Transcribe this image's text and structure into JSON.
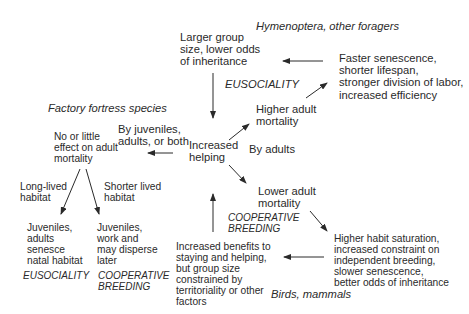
{
  "diagram": {
    "nodes": {
      "hymenoptera_label": "Hymenoptera, other foragers",
      "larger_group": "Larger group\nsize, lower odds\nof inheritance",
      "eusociality_top": "EUSOCIALITY",
      "faster_senescence": "Faster senescence,\nshorter lifespan,\nstronger division of labor,\nincreased efficiency",
      "higher_adult_mortality": "Higher adult\nmortality",
      "by_adults": "By adults",
      "factory_fortress_label": "Factory fortress species",
      "by_juveniles": "By juveniles,\nadults, or both",
      "increased_helping": "Increased\nhelping",
      "no_little_effect": "No or little\neffect on adult\nmortality",
      "long_lived_habitat": "Long-lived\nhabitat",
      "shorter_lived_habitat": "Shorter lived\nhabitat",
      "lower_adult_mortality": "Lower adult\nmortality",
      "cooperative_breeding_center": "COOPERATIVE\nBREEDING",
      "juveniles_adults_senesce": "Juveniles,\nadults\nsenesce\nnatal habitat",
      "juveniles_work_disperse": "Juveniles,\nwork and\nmay disperse\nlater",
      "eusociality_bottom": "EUSOCIALITY",
      "cooperative_breeding_bottom": "COOPERATIVE\nBREEDING",
      "increased_benefits": "Increased benefits to\nstaying and helping,\nbut group size\nconstrained by\nterritoriality or other\nfactors",
      "higher_habit_saturation": "Higher habit saturation,\nincreased constraint on\nindependent breeding,\nslower senescence,\nbetter odds of inheritance",
      "birds_mammals_label": "Birds, mammals"
    },
    "edges": [
      {
        "from": "larger_group",
        "to": "increased_helping"
      },
      {
        "from": "faster_senescence",
        "to": "larger_group"
      },
      {
        "from": "higher_adult_mortality",
        "to": "faster_senescence"
      },
      {
        "from": "increased_helping",
        "to": "higher_adult_mortality"
      },
      {
        "from": "increased_helping",
        "to": "no_little_effect"
      },
      {
        "from": "no_little_effect",
        "to": "juveniles_adults_senesce"
      },
      {
        "from": "no_little_effect",
        "to": "juveniles_work_disperse"
      },
      {
        "from": "increased_helping",
        "to": "lower_adult_mortality"
      },
      {
        "from": "lower_adult_mortality",
        "to": "higher_habit_saturation"
      },
      {
        "from": "higher_habit_saturation",
        "to": "increased_benefits"
      },
      {
        "from": "increased_benefits",
        "to": "increased_helping"
      }
    ],
    "colors": {
      "text": "#2a2a2a",
      "arrow": "#2a2a2a",
      "background": "#ffffff"
    }
  }
}
